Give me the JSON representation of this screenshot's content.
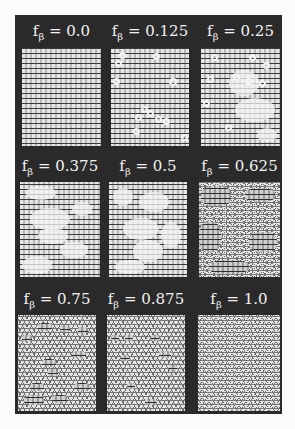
{
  "figure": {
    "background": "#fbfbfb",
    "panel_color": "#2a2a2a",
    "label_color": "#f2f2f2",
    "variable_base": "f",
    "variable_subscript": "β",
    "panels": [
      {
        "label_value": "= 0.0",
        "f_beta": 0.0,
        "pattern": "alpha"
      },
      {
        "label_value": "= 0.125",
        "f_beta": 0.125,
        "pattern": "alpha-with-beta-rings"
      },
      {
        "label_value": "= 0.25",
        "f_beta": 0.25,
        "pattern": "alpha-with-beta-clusters"
      },
      {
        "label_value": "= 0.375",
        "f_beta": 0.375,
        "pattern": "mixed"
      },
      {
        "label_value": "= 0.5",
        "f_beta": 0.5,
        "pattern": "mixed"
      },
      {
        "label_value": "= 0.625",
        "f_beta": 0.625,
        "pattern": "mixed"
      },
      {
        "label_value": "= 0.75",
        "f_beta": 0.75,
        "pattern": "beta-with-alpha-defects"
      },
      {
        "label_value": "= 0.875",
        "f_beta": 0.875,
        "pattern": "beta-with-alpha-defects"
      },
      {
        "label_value": "= 1.0",
        "f_beta": 1.0,
        "pattern": "beta"
      }
    ]
  }
}
